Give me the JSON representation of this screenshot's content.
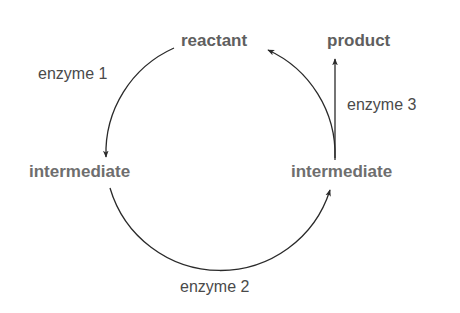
{
  "diagram": {
    "nodes": {
      "reactant": "reactant",
      "product": "product",
      "intermediate_left": "intermediate",
      "intermediate_right": "intermediate"
    },
    "enzymes": {
      "enzyme1": "enzyme 1",
      "enzyme2": "enzyme 2",
      "enzyme3": "enzyme 3"
    },
    "edges": [
      {
        "from": "reactant",
        "to": "intermediate_left",
        "label": "enzyme 1"
      },
      {
        "from": "intermediate_left",
        "to": "intermediate_right",
        "label": "enzyme 2"
      },
      {
        "from": "intermediate_right",
        "to": "reactant",
        "label": ""
      },
      {
        "from": "intermediate_right",
        "to": "product",
        "label": "enzyme 3"
      }
    ],
    "colors": {
      "node_text": "#6e6e6e",
      "enzyme_text": "#4a4a4a",
      "arrow": "#2a2a2a",
      "background": "#ffffff"
    }
  }
}
